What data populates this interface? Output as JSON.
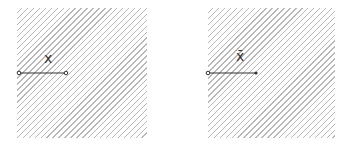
{
  "panels": [
    {
      "id": "left",
      "label": "x",
      "label_decoration": "none",
      "region": {
        "x": 17,
        "y": 8,
        "w": 130,
        "h": 130
      },
      "segment": {
        "x1": 19,
        "y1": 73,
        "x2": 66,
        "y2": 73,
        "end_start": "open-circle",
        "end_end": "open-circle"
      }
    },
    {
      "id": "right",
      "label": "x̄",
      "label_decoration": "overbar",
      "region": {
        "x": 208,
        "y": 8,
        "w": 127,
        "h": 130
      },
      "segment": {
        "x1": 208,
        "y1": 73,
        "x2": 256,
        "y2": 73,
        "end_start": "open-circle",
        "end_end": "arrow-dot"
      }
    }
  ],
  "colors": {
    "hatch": "#b8b8b8",
    "line": "#333333"
  }
}
